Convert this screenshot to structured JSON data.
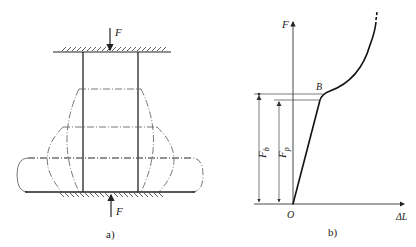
{
  "figure_a": {
    "caption": "a)",
    "top_force_label": "F",
    "bottom_force_label": "F",
    "description": "Cylindrical specimen compressed between two plates; dash-dot outlines show progressive barreling deformation"
  },
  "figure_b": {
    "caption": "b)",
    "y_axis_label": "F",
    "x_axis_label": "ΔL",
    "origin_label": "O",
    "point_label": "B",
    "dimension_fb_main": "F",
    "dimension_fb_sub": "b",
    "dimension_fp_main": "F",
    "dimension_fp_sub": "p"
  },
  "colors": {
    "line": "#222222",
    "thin_line": "#555555",
    "background": "#ffffff"
  }
}
